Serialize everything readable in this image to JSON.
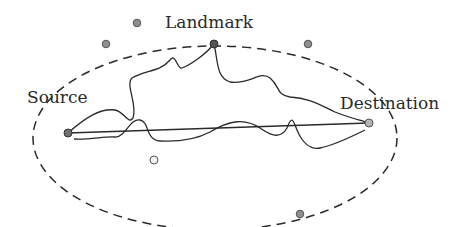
{
  "diagram": {
    "labels": {
      "landmark": "Landmark",
      "source": "Source",
      "destination": "Destination"
    },
    "colors": {
      "node_dark": "#555555",
      "node_mid": "#8e8e8e",
      "node_light": "#f2f2f2",
      "stroke": "#2a2a2a"
    },
    "nodes": [
      {
        "id": "source",
        "x": 68,
        "y": 133
      },
      {
        "id": "landmark",
        "x": 214,
        "y": 44
      },
      {
        "id": "destination",
        "x": 369,
        "y": 123
      },
      {
        "id": "outlier-1",
        "x": 137,
        "y": 23
      },
      {
        "id": "outlier-2",
        "x": 106,
        "y": 44
      },
      {
        "id": "outlier-3",
        "x": 308,
        "y": 44
      },
      {
        "id": "inside-1",
        "x": 154,
        "y": 160
      },
      {
        "id": "outlier-4",
        "x": 300,
        "y": 214
      }
    ],
    "region": {
      "shape": "ellipse",
      "style": "dashed"
    }
  }
}
